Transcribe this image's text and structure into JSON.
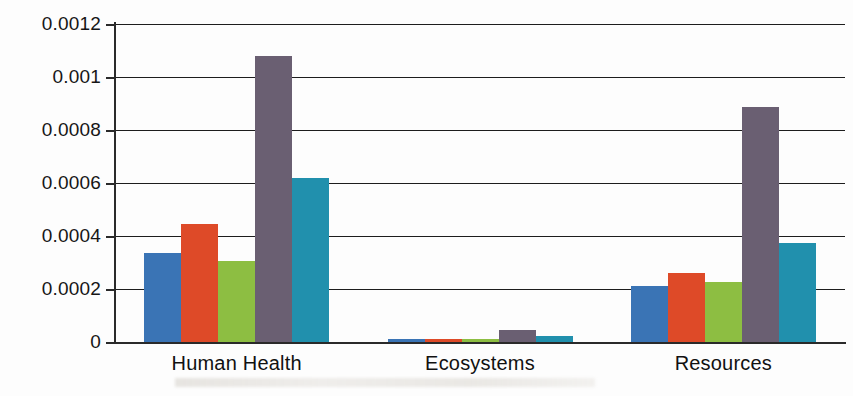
{
  "chart_data": {
    "type": "bar",
    "title": "",
    "xlabel": "",
    "ylabel": "",
    "categories": [
      "Human Health",
      "Ecosystems",
      "Resources"
    ],
    "ylim": [
      0,
      0.0012
    ],
    "ytick_labels": [
      "0.0012",
      "0.001",
      "0.0008",
      "0.0006",
      "0.0004",
      "0.0002",
      "0"
    ],
    "ytick_values": [
      0.0012,
      0.001,
      0.0008,
      0.0006,
      0.0004,
      0.0002,
      0
    ],
    "grid": true,
    "legend": "none",
    "series": [
      {
        "name": "Series 1",
        "color": "#3a74b5",
        "values": [
          0.000335,
          1.15e-05,
          0.00021
        ]
      },
      {
        "name": "Series 2",
        "color": "#de4a28",
        "values": [
          0.000445,
          1.15e-05,
          0.00026
        ]
      },
      {
        "name": "Series 3",
        "color": "#8dbe42",
        "values": [
          0.000305,
          1.1e-05,
          0.000225
        ]
      },
      {
        "name": "Series 4",
        "color": "#6a5f72",
        "values": [
          0.00108,
          4.6e-05,
          0.000888
        ]
      },
      {
        "name": "Series 5",
        "color": "#2190ad",
        "values": [
          0.00062,
          2.2e-05,
          0.000375
        ]
      }
    ]
  }
}
